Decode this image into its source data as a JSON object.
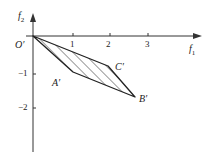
{
  "diagram": {
    "axes": {
      "x_label": "f",
      "x_label_sub": "1",
      "y_label": "f",
      "y_label_sub": "2",
      "origin_label": "O′",
      "x_ticks": [
        "1",
        "2",
        "3"
      ],
      "y_ticks": [
        "−1",
        "−2"
      ]
    },
    "points": {
      "A": "A′",
      "B": "B′",
      "C": "C′"
    },
    "region": "hatched quadrilateral O′A′B′C′"
  }
}
